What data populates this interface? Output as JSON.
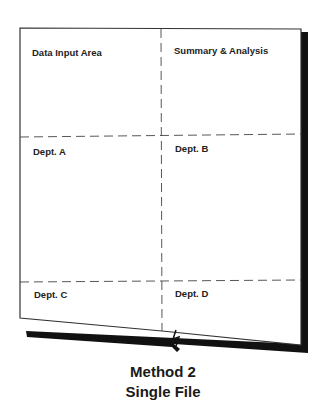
{
  "diagram": {
    "quadrants": [
      {
        "id": "data-input",
        "label": "Data Input Area"
      },
      {
        "id": "summary",
        "label": "Summary & Analysis"
      },
      {
        "id": "dept-a",
        "label": "Dept. A"
      },
      {
        "id": "dept-b",
        "label": "Dept. B"
      },
      {
        "id": "dept-c",
        "label": "Dept. C"
      },
      {
        "id": "dept-d",
        "label": "Dept. D"
      }
    ],
    "caption": {
      "line1": "Method 2",
      "line2": "Single File"
    }
  }
}
